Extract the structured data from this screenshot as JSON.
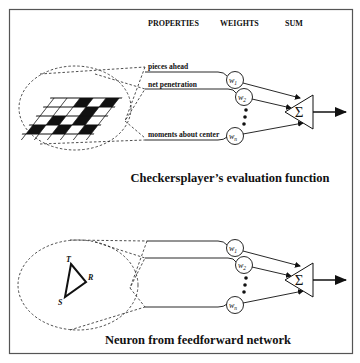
{
  "headers": {
    "properties": "PROPERTIES",
    "weights": "WEIGHTS",
    "sum": "SUM"
  },
  "top_panel": {
    "title": "Checkersplayer’s evaluation function",
    "inputs": [
      {
        "label": "pieces ahead",
        "weight": "w",
        "subscript": "1"
      },
      {
        "label": "net penetration",
        "weight": "w",
        "subscript": "2"
      },
      {
        "label": "moments about center",
        "weight": "w",
        "subscript": "n"
      }
    ],
    "sum_symbol": "Σ"
  },
  "bottom_panel": {
    "title": "Neuron from feedforward network",
    "triangle_vertices": [
      "T",
      "R",
      "S"
    ],
    "inputs": [
      {
        "weight": "w",
        "subscript": "1"
      },
      {
        "weight": "w",
        "subscript": "2"
      },
      {
        "weight": "w",
        "subscript": "n"
      }
    ],
    "sum_symbol": "Σ"
  },
  "colors": {
    "ink": "#111111",
    "frame": "#555555",
    "background": "#ffffff"
  }
}
